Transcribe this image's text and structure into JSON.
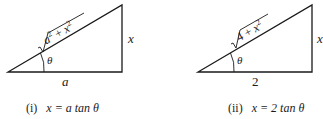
{
  "figures": [
    {
      "id": "i",
      "hypotenuse": {
        "radicand": "a² + x²",
        "base1": "a",
        "plus": "+",
        "base2": "x",
        "exp": "2"
      },
      "opposite": "x",
      "adjacent": "a",
      "angle": "θ",
      "caption_num": "(i)",
      "caption_eq": "x = a tan θ"
    },
    {
      "id": "ii",
      "hypotenuse": {
        "radicand": "4 + x²",
        "base1": "4",
        "plus": "+",
        "base2": "x",
        "exp": "2"
      },
      "opposite": "x",
      "adjacent": "2",
      "angle": "θ",
      "caption_num": "(ii)",
      "caption_eq": "x = 2 tan θ"
    }
  ],
  "colors": {
    "line": "#1a1a1a",
    "background": "#ffffff"
  }
}
